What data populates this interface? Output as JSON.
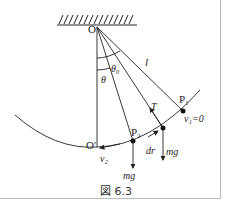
{
  "figure": {
    "caption": "図 6.3",
    "labels": {
      "pivot": "O",
      "bottom": "O'",
      "length": "l",
      "theta0": "θ₀",
      "theta": "θ",
      "tension": "T",
      "p1": "P₁",
      "p2": "P₂",
      "v1": "v₁=0",
      "v2": "v₂",
      "dr": "dr",
      "mg_p": "mg",
      "mg_p2": "mg"
    },
    "colors": {
      "ink": "#222222",
      "border": "#bbbbbb"
    }
  }
}
